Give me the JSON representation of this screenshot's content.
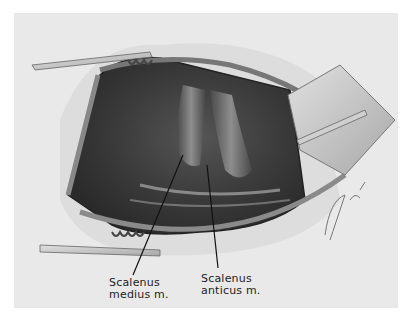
{
  "figure": {
    "colors": {
      "background": "#ffffff",
      "panel": "#e9e9e9",
      "cavity": "#3a3a3a",
      "retractor": "#c8c8c8"
    }
  },
  "labels": {
    "medius": {
      "line1": "Scalenus",
      "line2": "medius m."
    },
    "anticus": {
      "line1": "Scalenus",
      "line2": "anticus m."
    }
  },
  "signature": "artist-signature"
}
